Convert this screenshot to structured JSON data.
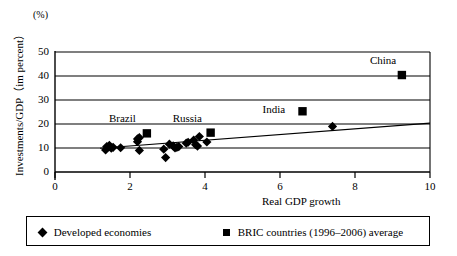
{
  "chart_data": {
    "type": "scatter",
    "title": "",
    "xlabel": "Real GDP growth",
    "ylabel": "Investments/GDP（im percent）",
    "unit_note": "(%)",
    "xlim": [
      0,
      10
    ],
    "ylim": [
      0,
      50
    ],
    "xticks": [
      "0",
      "2",
      "4",
      "6",
      "8",
      "10"
    ],
    "xtick_values": [
      0,
      2,
      4,
      6,
      8,
      10
    ],
    "yticks": [
      "0",
      "10",
      "20",
      "30",
      "40",
      "50"
    ],
    "ytick_values": [
      0,
      10,
      20,
      30,
      40,
      50
    ],
    "grid": "horizontal",
    "legend_position": "bottom",
    "series": [
      {
        "name": "Developed economies",
        "marker": "diamond",
        "color": "#000000",
        "points": [
          {
            "x": 1.35,
            "y": 9.2
          },
          {
            "x": 1.38,
            "y": 10.6
          },
          {
            "x": 1.45,
            "y": 11.1
          },
          {
            "x": 1.5,
            "y": 9.9
          },
          {
            "x": 1.55,
            "y": 10.3
          },
          {
            "x": 1.75,
            "y": 10.1
          },
          {
            "x": 2.2,
            "y": 13.8
          },
          {
            "x": 2.25,
            "y": 14.3
          },
          {
            "x": 2.2,
            "y": 12.6
          },
          {
            "x": 2.25,
            "y": 9.0
          },
          {
            "x": 2.9,
            "y": 9.5
          },
          {
            "x": 2.95,
            "y": 6.0
          },
          {
            "x": 3.05,
            "y": 11.6
          },
          {
            "x": 3.15,
            "y": 10.9
          },
          {
            "x": 3.2,
            "y": 10.0
          },
          {
            "x": 3.25,
            "y": 10.3
          },
          {
            "x": 3.3,
            "y": 10.6
          },
          {
            "x": 3.5,
            "y": 12.0
          },
          {
            "x": 3.55,
            "y": 12.4
          },
          {
            "x": 3.7,
            "y": 13.3
          },
          {
            "x": 3.75,
            "y": 11.4
          },
          {
            "x": 3.8,
            "y": 10.8
          },
          {
            "x": 3.85,
            "y": 14.8
          },
          {
            "x": 4.05,
            "y": 12.5
          },
          {
            "x": 7.4,
            "y": 19.0
          }
        ]
      },
      {
        "name": "BRIC countries (1996–2006) average",
        "marker": "square",
        "color": "#000000",
        "points": [
          {
            "x": 2.45,
            "y": 16.1,
            "label": "Brazil",
            "label_pos": "above-left"
          },
          {
            "x": 4.15,
            "y": 16.4,
            "label": "Russia",
            "label_pos": "above-left"
          },
          {
            "x": 6.6,
            "y": 25.3,
            "label": "India",
            "label_pos": "left"
          },
          {
            "x": 9.25,
            "y": 40.4,
            "label": "China",
            "label_pos": "above-left"
          }
        ]
      }
    ],
    "trendline": {
      "x0": 1.2,
      "y0": 9.9,
      "x1": 10.0,
      "y1": 20.4
    },
    "annotations": [
      "Brazil",
      "Russia",
      "India",
      "China"
    ]
  },
  "legend": {
    "items": [
      {
        "marker": "diamond",
        "label": "Developed economies"
      },
      {
        "marker": "square",
        "label": "BRIC countries (1996–2006) average"
      }
    ]
  }
}
